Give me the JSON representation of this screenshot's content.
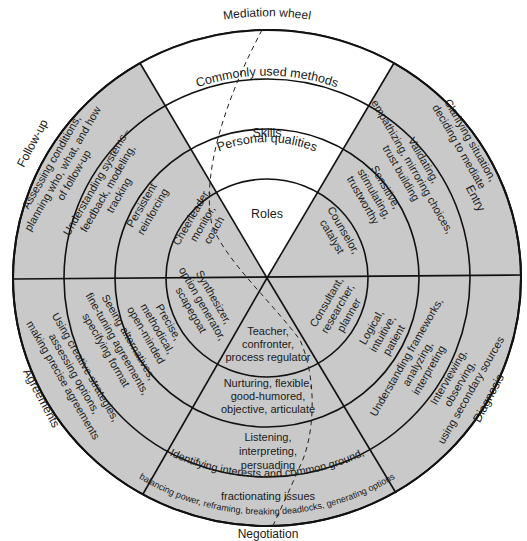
{
  "title": "Mediation wheel",
  "colors": {
    "shaded": "#c9c9c9",
    "white": "#ffffff",
    "line": "#111111",
    "text": "#1a1a1a"
  },
  "geometry": {
    "cx": 267,
    "cy": 278,
    "radii": [
      101,
      152,
      203,
      254
    ]
  },
  "ring_labels": {
    "roles": "Roles",
    "personal_qualities": "Personal qualities",
    "skills": "Skills",
    "methods": "Commonly used methods"
  },
  "stages": {
    "entry": "Entry",
    "diagnosis": "Diagnosis",
    "negotiation": "Negotiation",
    "agreements": "Agreements",
    "follow_up": "Follow-up"
  },
  "sectors": {
    "entry": {
      "roles": [
        "Counselor,",
        "catalyst"
      ],
      "qualities": [
        "Sensitive,",
        "stimulating,",
        "trustworthy"
      ],
      "skills": [
        "Validating,",
        "empathizing, mirroring choices,",
        "trust building"
      ],
      "methods": [
        "Clarifying situation,",
        "deciding to mediate"
      ]
    },
    "diagnosis": {
      "roles": [
        "Consultant,",
        "researcher,",
        "planner"
      ],
      "qualities": [
        "Logical,",
        "intuitive,",
        "patient"
      ],
      "skills": [
        "Understanding frameworks,",
        "analyzing,",
        "interpreting"
      ],
      "methods": [
        "Interviewing,",
        "observing,",
        "using secondary sources"
      ]
    },
    "negotiation": {
      "roles": [
        "Teacher,",
        "confronter,",
        "process regulator"
      ],
      "qualities": [
        "Nurturing, flexible,",
        "good-humored,",
        "objective, articulate"
      ],
      "skills": [
        "Listening,",
        "interpreting,",
        "persuading"
      ],
      "methods": [
        "Identifying interests and common ground,",
        "fractionating issues"
      ],
      "methods_outer": "balancing power, reframing, breaking deadlocks, generating options"
    },
    "agreements": {
      "roles": [
        "Synthesizer,",
        "option generator,",
        "scapegoat"
      ],
      "qualities": [
        "Precise,",
        "methodical,",
        "open-minded"
      ],
      "skills": [
        "Seeing alternatives,",
        "fine-tuning agreements,",
        "specifying format"
      ],
      "methods": [
        "Using creative strategies,",
        "assessing options,",
        "making precise agreements"
      ]
    },
    "follow_up": {
      "roles": [
        "Cheerleader,",
        "monitor,",
        "coach"
      ],
      "qualities": [
        "Persistent",
        "reinforcing"
      ],
      "skills": [
        "Understanding systems–",
        "feedback, modeling,",
        "tracking"
      ],
      "methods": [
        "Assessing conditions,",
        "planning who, what, and how",
        "of follow-up"
      ]
    }
  }
}
